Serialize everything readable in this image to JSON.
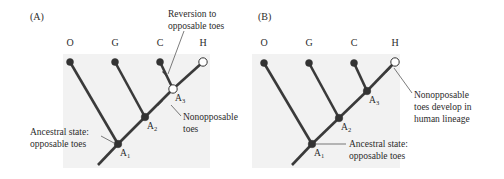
{
  "colors": {
    "background": "#ffffff",
    "panel_bg": "#f2f2f2",
    "branch": "#3a3a3a",
    "filled_node": "#333333",
    "open_node": "#ffffff",
    "text": "#2b2b2b"
  },
  "panels": [
    {
      "id": "A",
      "label": "(A)",
      "label_pos": [
        30,
        20
      ],
      "bg": [
        63,
        54,
        147,
        114
      ],
      "taxa": [
        {
          "name": "O",
          "x": 70,
          "y": 62,
          "label_y": 46,
          "state": "filled"
        },
        {
          "name": "G",
          "x": 115,
          "y": 62,
          "label_y": 46,
          "state": "filled"
        },
        {
          "name": "C",
          "x": 160,
          "y": 62,
          "label_y": 46,
          "state": "filled"
        },
        {
          "name": "H",
          "x": 203,
          "y": 62,
          "label_y": 46,
          "state": "open"
        }
      ],
      "nodes": [
        {
          "name": "A",
          "sub": "1",
          "x": 118,
          "y": 144,
          "state": "filled"
        },
        {
          "name": "A",
          "sub": "2",
          "x": 145,
          "y": 117,
          "state": "filled"
        },
        {
          "name": "A",
          "sub": "3",
          "x": 173,
          "y": 89,
          "state": "open"
        }
      ],
      "root": [
        98,
        165
      ],
      "ticks": [
        {
          "x": 165,
          "y": 74,
          "angle": 45
        },
        {
          "x": 160,
          "y": 103,
          "angle": -45
        }
      ],
      "annotations": [
        {
          "lines": [
            "Reversion to",
            "opposable toes"
          ],
          "x": 168,
          "y": 17,
          "anchor": "start",
          "leader": [
            184,
            31,
            168,
            74
          ]
        },
        {
          "lines": [
            "Nonopposable",
            "toes"
          ],
          "x": 183,
          "y": 120,
          "anchor": "start",
          "leader": [
            171,
            105,
            181,
            116
          ]
        },
        {
          "lines": [
            "Ancestral state:",
            "opposable toes"
          ],
          "x": 30,
          "y": 135,
          "anchor": "start",
          "leader": [
            101,
            136,
            114,
            143
          ]
        }
      ]
    },
    {
      "id": "B",
      "label": "(B)",
      "label_pos": [
        258,
        20
      ],
      "bg": [
        252,
        54,
        148,
        114
      ],
      "taxa": [
        {
          "name": "O",
          "x": 264,
          "y": 63,
          "label_y": 46,
          "state": "filled"
        },
        {
          "name": "G",
          "x": 309,
          "y": 63,
          "label_y": 46,
          "state": "filled"
        },
        {
          "name": "C",
          "x": 354,
          "y": 63,
          "label_y": 46,
          "state": "filled"
        },
        {
          "name": "H",
          "x": 395,
          "y": 62,
          "label_y": 46,
          "state": "open"
        }
      ],
      "nodes": [
        {
          "name": "A",
          "sub": "1",
          "x": 312,
          "y": 144,
          "state": "filled"
        },
        {
          "name": "A",
          "sub": "2",
          "x": 339,
          "y": 118,
          "state": "filled"
        },
        {
          "name": "A",
          "sub": "3",
          "x": 367,
          "y": 91,
          "state": "filled"
        }
      ],
      "root": [
        292,
        165
      ],
      "ticks": [
        {
          "x": 388,
          "y": 70,
          "angle": -45
        }
      ],
      "annotations": [
        {
          "lines": [
            "Nonopposable",
            "toes develop in",
            "human lineage"
          ],
          "x": 414,
          "y": 98,
          "anchor": "start",
          "leader": [
            394,
            68,
            412,
            93
          ]
        },
        {
          "lines": [
            "Ancestral state:",
            "opposable toes"
          ],
          "x": 349,
          "y": 147,
          "anchor": "start",
          "leader": [
            316,
            144,
            346,
            144
          ]
        }
      ]
    }
  ]
}
